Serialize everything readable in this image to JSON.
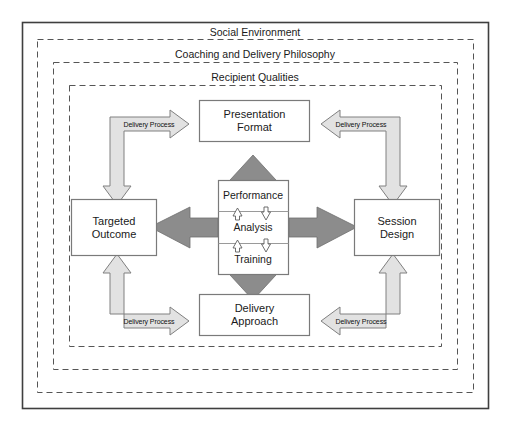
{
  "figure": {
    "type": "concentric-cycle-diagram",
    "bands": [
      {
        "id": "social-environment",
        "label": "Social Environment"
      },
      {
        "id": "coaching-philosophy",
        "label": "Coaching and Delivery Philosophy"
      },
      {
        "id": "recipient-qualities",
        "label": "Recipient Qualities"
      }
    ],
    "outer_nodes": [
      {
        "id": "presentation-format",
        "lines": [
          "Presentation",
          "Format"
        ],
        "position": "top"
      },
      {
        "id": "session-design",
        "lines": [
          "Session",
          "Design"
        ],
        "position": "right"
      },
      {
        "id": "delivery-approach",
        "lines": [
          "Delivery",
          "Approach"
        ],
        "position": "bottom"
      },
      {
        "id": "targeted-outcome",
        "lines": [
          "Targeted",
          "Outcome"
        ],
        "position": "left"
      }
    ],
    "center_node": {
      "id": "performance-analysis-training",
      "rows": [
        {
          "id": "performance",
          "label": "Performance"
        },
        {
          "id": "analysis",
          "label": "Analysis"
        },
        {
          "id": "training",
          "label": "Training"
        }
      ]
    },
    "process_arrows": [
      {
        "id": "delivery-process-top-left",
        "label": "Delivery Process",
        "corner": "top-left"
      },
      {
        "id": "delivery-process-top-right",
        "label": "Delivery Process",
        "corner": "top-right"
      },
      {
        "id": "delivery-process-bottom-left",
        "label": "Delivery Process",
        "corner": "bottom-left"
      },
      {
        "id": "delivery-process-bottom-right",
        "label": "Delivery Process",
        "corner": "bottom-right"
      }
    ],
    "colors": {
      "frame_stroke": "#3f3f3f",
      "band_stroke": "#555555",
      "box_stroke": "#7a7a7a",
      "light_arrow_fill": "#e2e2e2",
      "light_arrow_stroke": "#808080",
      "dark_arrow_fill": "#8c8c8c",
      "dark_arrow_stroke": "#6e6e6e",
      "small_arrow_fill": "#ffffff",
      "text": "#1a1a1a",
      "background": "#ffffff"
    }
  }
}
